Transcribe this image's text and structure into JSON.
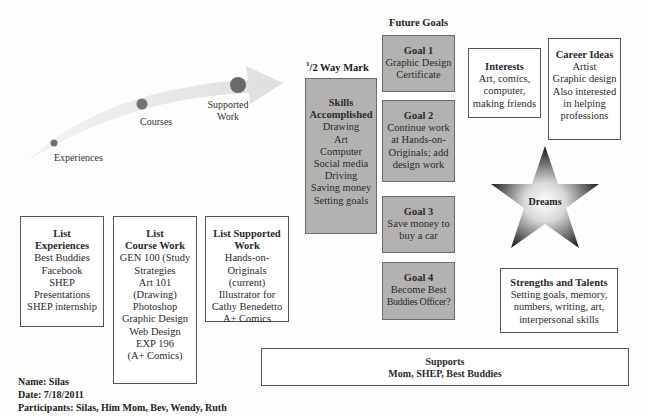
{
  "path": {
    "stages": [
      {
        "label": "Experiences"
      },
      {
        "label": "Courses"
      },
      {
        "label": "Supported Work"
      }
    ]
  },
  "headers": {
    "halfway_mark": "1/2 Way Mark",
    "halfway_sup": "1",
    "halfway_rest": "/2 Way Mark",
    "future_goals": "Future Goals"
  },
  "skills": {
    "title_line1": "Skills",
    "title_line2": "Accomplished",
    "items": [
      "Drawing",
      "Art",
      "Computer",
      "Social media",
      "Driving",
      "Saving money",
      "Setting goals"
    ]
  },
  "goals": [
    {
      "title": "Goal 1",
      "lines": [
        "Graphic Design",
        "Certificate"
      ]
    },
    {
      "title": "Goal 2",
      "lines": [
        "Continue work",
        "at Hands-on-",
        "Originals; add",
        "design work"
      ]
    },
    {
      "title": "Goal 3",
      "lines": [
        "Save money to",
        "buy a car"
      ]
    },
    {
      "title": "Goal 4",
      "lines": [
        "Become Best",
        "Buddies Officer?"
      ]
    }
  ],
  "interests": {
    "title": "Interests",
    "lines": [
      "Art, comics,",
      "computer,",
      "making friends"
    ]
  },
  "career_ideas": {
    "title": "Career Ideas",
    "lines": [
      "Artist",
      "Graphic design",
      "Also interested",
      "in helping",
      "professions"
    ]
  },
  "dreams": {
    "label": "Dreams"
  },
  "strengths": {
    "title": "Strengths and Talents",
    "lines": [
      "Setting goals, memory,",
      "numbers, writing, art,",
      "interpersonal skills"
    ]
  },
  "lists": {
    "experiences": {
      "title_line1": "List",
      "title_line2": "Experiences",
      "items": [
        "Best Buddies",
        "Facebook",
        "SHEP",
        "Presentations",
        "SHEP internship"
      ]
    },
    "course_work": {
      "title_line1": "List",
      "title_line2": "Course Work",
      "items": [
        "GEN 100 (Study",
        "Strategies",
        "Art 101",
        "(Drawing)",
        "Photoshop",
        "Graphic Design",
        "Web Design",
        "EXP 196",
        "(A+ Comics)"
      ]
    },
    "supported_work": {
      "title_line1": "List Supported",
      "title_line2": "Work",
      "items": [
        "Hands-on-",
        "Originals",
        "(current)",
        "Illustrator for",
        "Cathy Benedetto",
        "A+ Comics"
      ]
    }
  },
  "supports": {
    "title": "Supports",
    "text": "Mom, SHEP, Best Buddies"
  },
  "meta": {
    "name": "Name: Silas",
    "date": "Date: 7/18/2011",
    "participants": "Participants: Silas, Him Mom, Bev, Wendy, Ruth"
  },
  "colors": {
    "goal_fill": "#b3b2b0",
    "arrow_fill": "#e6e6e6",
    "dot_fill": "#6e6e6e"
  }
}
